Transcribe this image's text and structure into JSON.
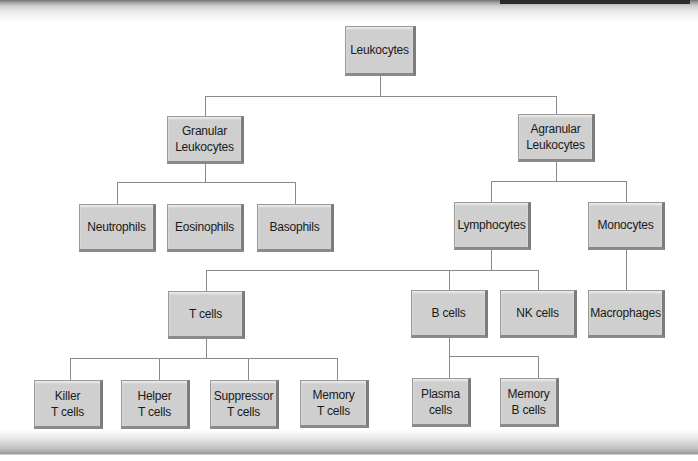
{
  "diagram": {
    "type": "hierarchy-tree",
    "root": "Leukocytes",
    "nodes": {
      "leukocytes": {
        "lines": [
          "Leukocytes"
        ]
      },
      "granular": {
        "lines": [
          "Granular",
          "Leukocytes"
        ]
      },
      "agranular": {
        "lines": [
          "Agranular",
          "Leukocytes"
        ]
      },
      "neutrophils": {
        "lines": [
          "Neutrophils"
        ]
      },
      "eosinophils": {
        "lines": [
          "Eosinophils"
        ]
      },
      "basophils": {
        "lines": [
          "Basophils"
        ]
      },
      "lymphocytes": {
        "lines": [
          "Lymphocytes"
        ]
      },
      "monocytes": {
        "lines": [
          "Monocytes"
        ]
      },
      "t_cells": {
        "lines": [
          "T cells"
        ]
      },
      "b_cells": {
        "lines": [
          "B cells"
        ]
      },
      "nk_cells": {
        "lines": [
          "NK cells"
        ]
      },
      "macrophages": {
        "lines": [
          "Macrophages"
        ]
      },
      "killer_t": {
        "lines": [
          "Killer",
          "T cells"
        ]
      },
      "helper_t": {
        "lines": [
          "Helper",
          "T cells"
        ]
      },
      "suppressor_t": {
        "lines": [
          "Suppressor",
          "T cells"
        ]
      },
      "memory_t": {
        "lines": [
          "Memory",
          "T cells"
        ]
      },
      "plasma": {
        "lines": [
          "Plasma",
          "cells"
        ]
      },
      "memory_b": {
        "lines": [
          "Memory",
          "B cells"
        ]
      }
    },
    "edges": [
      [
        "Leukocytes",
        "Granular Leukocytes"
      ],
      [
        "Leukocytes",
        "Agranular Leukocytes"
      ],
      [
        "Granular Leukocytes",
        "Neutrophils"
      ],
      [
        "Granular Leukocytes",
        "Eosinophils"
      ],
      [
        "Granular Leukocytes",
        "Basophils"
      ],
      [
        "Agranular Leukocytes",
        "Lymphocytes"
      ],
      [
        "Agranular Leukocytes",
        "Monocytes"
      ],
      [
        "Lymphocytes",
        "T cells"
      ],
      [
        "Lymphocytes",
        "B cells"
      ],
      [
        "Lymphocytes",
        "NK cells"
      ],
      [
        "Monocytes",
        "Macrophages"
      ],
      [
        "T cells",
        "Killer T cells"
      ],
      [
        "T cells",
        "Helper T cells"
      ],
      [
        "T cells",
        "Suppressor T cells"
      ],
      [
        "T cells",
        "Memory T cells"
      ],
      [
        "B cells",
        "Plasma cells"
      ],
      [
        "B cells",
        "Memory B cells"
      ]
    ],
    "colors": {
      "node_fill": "#cfcfcf",
      "node_border": "#9a9a9a",
      "node_shadow": "#7c7c7c",
      "connector": "#8a8a8a",
      "text": "#1a1a1a",
      "background": "#ffffff"
    }
  }
}
